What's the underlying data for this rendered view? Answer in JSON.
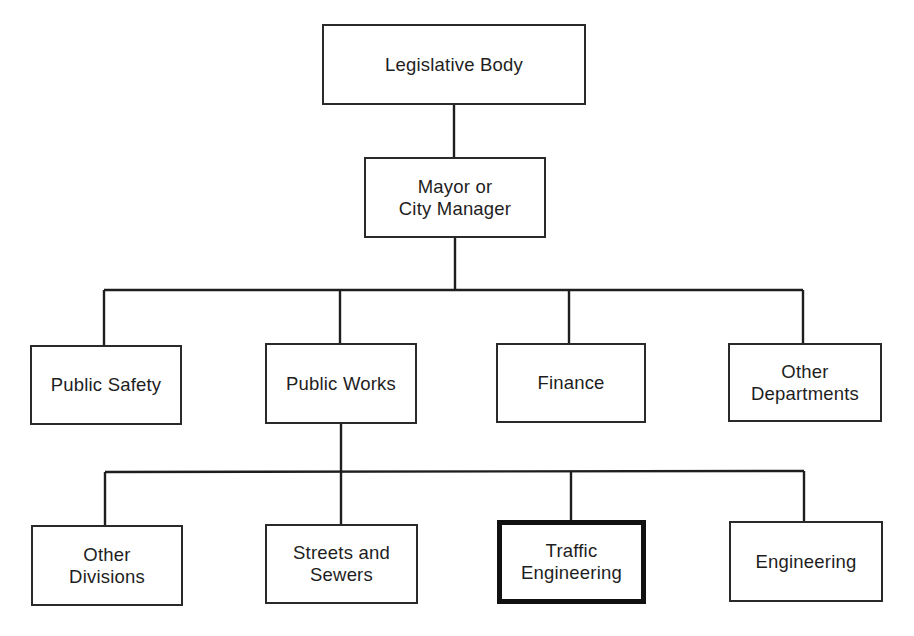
{
  "diagram": {
    "type": "org-chart",
    "title": "",
    "highlighted_node": "traffic-engineering",
    "colors": {
      "line": "#1e1e1e",
      "box_border": "#2a2a2a",
      "highlight_border": "#111111",
      "background": "#ffffff",
      "text": "#1e1e1e"
    },
    "nodes": {
      "legislative_body": {
        "id": "legislative-body",
        "lines": [
          "Legislative Body"
        ],
        "parent": null,
        "level": 0
      },
      "mayor": {
        "id": "mayor-or-city-manager",
        "lines": [
          "Mayor or",
          "City Manager"
        ],
        "parent": "legislative-body",
        "level": 1
      },
      "public_safety": {
        "id": "public-safety",
        "lines": [
          "Public Safety"
        ],
        "parent": "mayor-or-city-manager",
        "level": 2
      },
      "public_works": {
        "id": "public-works",
        "lines": [
          "Public Works"
        ],
        "parent": "mayor-or-city-manager",
        "level": 2
      },
      "finance": {
        "id": "finance",
        "lines": [
          "Finance"
        ],
        "parent": "mayor-or-city-manager",
        "level": 2
      },
      "other_departments": {
        "id": "other-departments",
        "lines": [
          "Other",
          "Departments"
        ],
        "parent": "mayor-or-city-manager",
        "level": 2
      },
      "other_divisions": {
        "id": "other-divisions",
        "lines": [
          "Other",
          "Divisions"
        ],
        "parent": "public-works",
        "level": 3
      },
      "streets_sewers": {
        "id": "streets-and-sewers",
        "lines": [
          "Streets and",
          "Sewers"
        ],
        "parent": "public-works",
        "level": 3
      },
      "traffic_engineering": {
        "id": "traffic-engineering",
        "lines": [
          "Traffic",
          "Engineering"
        ],
        "parent": "public-works",
        "level": 3,
        "highlighted": true
      },
      "engineering": {
        "id": "engineering",
        "lines": [
          "Engineering"
        ],
        "parent": "public-works",
        "level": 3
      }
    }
  }
}
